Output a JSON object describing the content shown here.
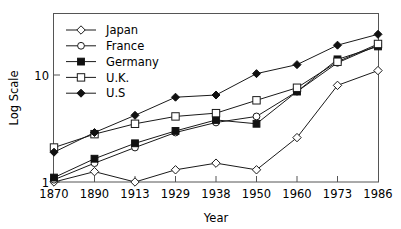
{
  "chart_data": {
    "type": "line",
    "title": "",
    "xlabel": "Year",
    "ylabel": "Log Scale",
    "yscale": "log",
    "ylim": [
      1,
      30
    ],
    "ytick_labels": [
      "1",
      "10"
    ],
    "ytick_values": [
      1,
      10
    ],
    "grid": false,
    "legend_position": "top-left",
    "categories": [
      "1870",
      "1890",
      "1913",
      "1929",
      "1938",
      "1950",
      "1960",
      "1973",
      "1986"
    ],
    "series": [
      {
        "name": "Japan",
        "marker": "open-diamond",
        "values": [
          1.0,
          1.25,
          1.0,
          1.3,
          1.5,
          1.3,
          2.6,
          8.0,
          11.0
        ]
      },
      {
        "name": "France",
        "marker": "open-circle",
        "values": [
          1.05,
          1.5,
          2.1,
          2.9,
          3.6,
          4.1,
          7.0,
          13.0,
          19.0
        ]
      },
      {
        "name": "Germany",
        "marker": "filled-square",
        "values": [
          1.1,
          1.65,
          2.3,
          3.0,
          3.8,
          3.5,
          7.0,
          14.0,
          18.5
        ]
      },
      {
        "name": "U.K.",
        "marker": "open-square",
        "values": [
          2.1,
          2.8,
          3.5,
          4.1,
          4.4,
          5.8,
          7.6,
          13.3,
          19.5
        ]
      },
      {
        "name": "U.S",
        "marker": "filled-diamond",
        "values": [
          1.9,
          2.9,
          4.2,
          6.2,
          6.5,
          10.3,
          12.5,
          19.0,
          24.0
        ]
      }
    ]
  },
  "legend": {
    "items": [
      {
        "label": "Japan"
      },
      {
        "label": "France"
      },
      {
        "label": "Germany"
      },
      {
        "label": "U.K."
      },
      {
        "label": "U.S"
      }
    ]
  },
  "colors": {
    "line": "#1a1a1a",
    "axis": "#555555",
    "marker_fill": "#111111",
    "marker_open": "#ffffff",
    "background": "#ffffff"
  }
}
